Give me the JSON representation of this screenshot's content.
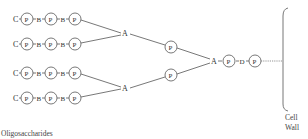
{
  "diagram": {
    "type": "branched-chain",
    "caption": "Oligosaccharides",
    "wall_label_line1": "Cell",
    "wall_label_line2": "Wall",
    "chains": [
      {
        "units": [
          "C",
          "P",
          "B",
          "P",
          "B",
          "P"
        ]
      },
      {
        "units": [
          "C",
          "P",
          "B",
          "P",
          "B",
          "P"
        ]
      },
      {
        "units": [
          "C",
          "P",
          "B",
          "P",
          "B",
          "P"
        ]
      },
      {
        "units": [
          "C",
          "P",
          "B",
          "P",
          "B",
          "P"
        ]
      }
    ],
    "junctions": {
      "upper_A": "A",
      "lower_A": "A",
      "upper_P": "P",
      "lower_P": "P",
      "stem": [
        "A",
        "P",
        "D",
        "P"
      ]
    },
    "labels": {
      "C": "C",
      "P": "P",
      "B": "B",
      "A": "A",
      "D": "D"
    }
  }
}
